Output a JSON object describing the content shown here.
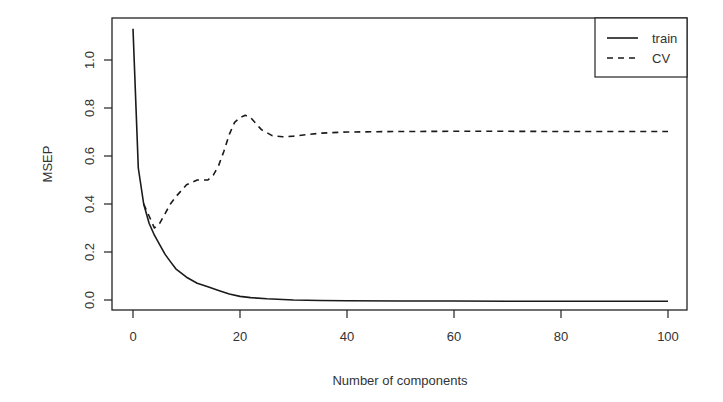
{
  "chart_data": {
    "type": "line",
    "title": "",
    "xlabel": "Number of components",
    "ylabel": "MSEP",
    "xlim": [
      0,
      100
    ],
    "ylim": [
      -0.04,
      1.16
    ],
    "xticks": [
      0,
      20,
      40,
      60,
      80,
      100
    ],
    "yticks": [
      "0.0",
      "0.2",
      "0.4",
      "0.6",
      "0.8",
      "1.0"
    ],
    "grid": false,
    "legend_position": "top-right",
    "series": [
      {
        "name": "train",
        "style": "solid",
        "x": [
          0,
          1,
          2,
          3,
          4,
          5,
          6,
          7,
          8,
          10,
          12,
          14,
          16,
          18,
          20,
          22,
          25,
          30,
          35,
          40,
          50,
          60,
          70,
          80,
          90,
          100
        ],
        "values": [
          1.13,
          0.55,
          0.4,
          0.32,
          0.27,
          0.23,
          0.19,
          0.16,
          0.13,
          0.095,
          0.07,
          0.055,
          0.04,
          0.025,
          0.015,
          0.01,
          0.005,
          0.0,
          -0.002,
          -0.003,
          -0.004,
          -0.004,
          -0.005,
          -0.005,
          -0.005,
          -0.005
        ]
      },
      {
        "name": "CV",
        "style": "dashed",
        "x": [
          2,
          3,
          4,
          5,
          6,
          7,
          8,
          10,
          12,
          14,
          15,
          16,
          17,
          18,
          19,
          20,
          21,
          22,
          24,
          26,
          28,
          30,
          35,
          40,
          50,
          60,
          70,
          80,
          90,
          100
        ],
        "values": [
          0.4,
          0.35,
          0.3,
          0.32,
          0.36,
          0.4,
          0.43,
          0.48,
          0.5,
          0.5,
          0.52,
          0.56,
          0.62,
          0.69,
          0.74,
          0.76,
          0.77,
          0.76,
          0.71,
          0.685,
          0.68,
          0.683,
          0.695,
          0.7,
          0.702,
          0.703,
          0.703,
          0.702,
          0.702,
          0.702
        ]
      }
    ]
  },
  "legend": {
    "items": [
      {
        "label": "train",
        "style": "solid"
      },
      {
        "label": "CV",
        "style": "dashed"
      }
    ]
  },
  "colors": {
    "line": "#1a1a1a",
    "axis": "#222222",
    "text": "#333333",
    "background": "#ffffff"
  }
}
